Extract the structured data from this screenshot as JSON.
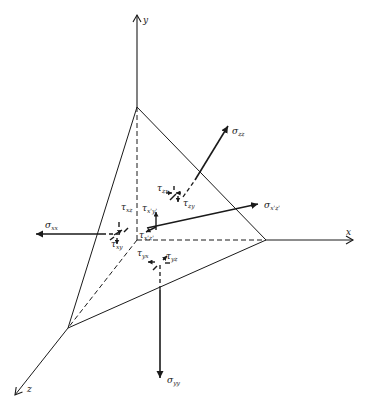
{
  "diagram": {
    "type": "stress tetrahedron",
    "axes": {
      "x": "x",
      "y": "y",
      "z": "z"
    },
    "labels": {
      "sigma_zz": {
        "sym": "σ",
        "sub": "zz"
      },
      "sigma_xx": {
        "sym": "σ",
        "sub": "xx"
      },
      "sigma_yy": {
        "sym": "σ",
        "sub": "yy"
      },
      "sigma_xz_prime": {
        "sym": "σ",
        "sub": "x'z'"
      },
      "tau_zx": {
        "sym": "τ",
        "sub": "zx"
      },
      "tau_zy": {
        "sym": "τ",
        "sub": "zy"
      },
      "tau_xz": {
        "sym": "τ",
        "sub": "xz"
      },
      "tau_xy": {
        "sym": "τ",
        "sub": "xy"
      },
      "tau_yx": {
        "sym": "τ",
        "sub": "yx"
      },
      "tau_yz": {
        "sym": "τ",
        "sub": "yz"
      },
      "tau_xy_prime": {
        "sym": "τ",
        "sub": "x'y'"
      },
      "tau_xz_prime": {
        "sym": "τ",
        "sub": "x'z'"
      }
    },
    "colors": {
      "line": "#1a1a1a",
      "background": "#ffffff"
    }
  }
}
